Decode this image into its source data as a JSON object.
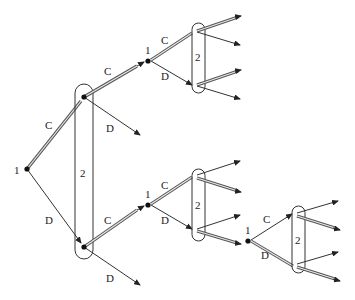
{
  "diagram": {
    "type": "extensive-form game tree (repeated prisoner's dilemma)",
    "players": [
      "1",
      "2"
    ],
    "actions": [
      "C",
      "D"
    ],
    "nodes": {
      "root": {
        "player": "1",
        "x": 27,
        "y": 169
      },
      "p2_upper": {
        "x": 84,
        "y": 97
      },
      "p2_lower": {
        "x": 84,
        "y": 247
      },
      "stage2_top": {
        "player": "1",
        "x": 148,
        "y": 61
      },
      "stage2_mid": {
        "player": "1",
        "x": 148,
        "y": 205
      },
      "stage3": {
        "player": "1",
        "x": 248,
        "y": 241
      }
    },
    "labels": {
      "root_player": "1",
      "root_C": "C",
      "root_D": "D",
      "info_set_1": "2",
      "upper_C": "C",
      "upper_D": "D",
      "lower_C": "C",
      "lower_D": "D",
      "top_player": "1",
      "top_C": "C",
      "top_D": "D",
      "top_info_set": "2",
      "mid_player": "1",
      "mid_C": "C",
      "mid_D": "D",
      "mid_info_set": "2",
      "third_player": "1",
      "third_C": "C",
      "third_D": "D",
      "third_info_set": "2"
    }
  }
}
